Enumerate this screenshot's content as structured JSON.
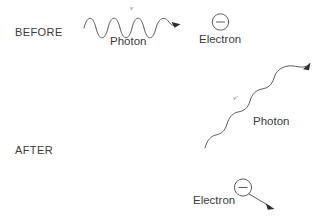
{
  "diagram": {
    "background_color": "#ffffff",
    "stroke_color": "#4a4a4a",
    "text_color": "#3b3b3b"
  },
  "before": {
    "phase_label": "BEFORE",
    "photon_label": "Photon",
    "photon_symbol": "ν",
    "electron_label": "Electron",
    "electron_charge_sign": "−"
  },
  "after": {
    "phase_label": "AFTER",
    "photon_label": "Photon",
    "photon_symbol": "ν′",
    "electron_label": "Electron",
    "electron_charge_sign": "−"
  }
}
